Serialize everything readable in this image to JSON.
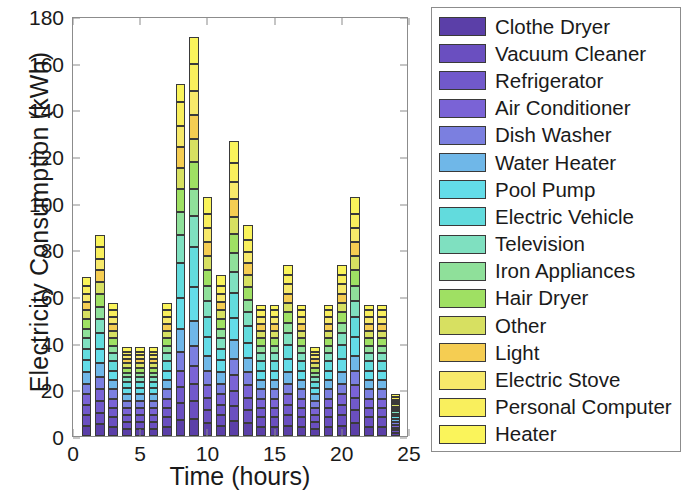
{
  "chart_data": {
    "type": "bar",
    "stacked": true,
    "title": "",
    "xlabel": "Time (hours)",
    "ylabel": "Electricity Consumption  (kWh)",
    "xlim": [
      0,
      25
    ],
    "ylim": [
      0,
      180
    ],
    "xticks": [
      0,
      5,
      10,
      15,
      20,
      25
    ],
    "yticks": [
      0,
      20,
      40,
      60,
      80,
      100,
      120,
      140,
      160,
      180
    ],
    "grid": false,
    "legend_position": "right-outside",
    "x": [
      1,
      2,
      3,
      4,
      5,
      6,
      7,
      8,
      9,
      10,
      11,
      12,
      13,
      14,
      15,
      16,
      17,
      18,
      19,
      20,
      21,
      22,
      23,
      24
    ],
    "totals": [
      68,
      86,
      51,
      34,
      34,
      34,
      51,
      154,
      171,
      103,
      69,
      120,
      86,
      51,
      51,
      69,
      51,
      35,
      51,
      69,
      103,
      51,
      51,
      17
    ],
    "series": [
      {
        "name": "Clothe Dryer",
        "color": "#5b3fa8",
        "values": [
          4.5,
          5.0,
          4.0,
          3.0,
          3.0,
          3.0,
          4.0,
          7.0,
          7.5,
          5.5,
          4.5,
          6.5,
          5.5,
          4.0,
          4.0,
          4.5,
          4.0,
          3.0,
          4.0,
          4.5,
          5.5,
          4.0,
          4.0,
          1.2
        ]
      },
      {
        "name": "Vacuum Cleaner",
        "color": "#6a4fc0",
        "values": [
          4.5,
          5.0,
          4.0,
          3.0,
          3.0,
          3.0,
          4.0,
          7.0,
          7.5,
          5.5,
          4.5,
          6.5,
          5.5,
          4.0,
          4.0,
          4.5,
          4.0,
          3.0,
          4.0,
          4.5,
          5.5,
          4.0,
          4.0,
          1.2
        ]
      },
      {
        "name": "Refrigerator",
        "color": "#7159cb",
        "values": [
          4.5,
          5.0,
          4.0,
          3.0,
          3.0,
          3.0,
          4.0,
          7.0,
          7.5,
          5.5,
          4.5,
          6.5,
          5.5,
          4.0,
          4.0,
          4.5,
          4.0,
          3.0,
          4.0,
          4.5,
          5.5,
          4.0,
          4.0,
          1.2
        ]
      },
      {
        "name": "Air Conditioner",
        "color": "#7a63d6",
        "values": [
          4.5,
          5.0,
          4.0,
          3.0,
          3.0,
          3.0,
          4.0,
          7.0,
          7.5,
          5.5,
          4.5,
          6.5,
          5.5,
          4.0,
          4.0,
          4.5,
          4.0,
          3.0,
          4.0,
          4.5,
          5.5,
          4.0,
          4.0,
          1.2
        ]
      },
      {
        "name": "Dish Washer",
        "color": "#7b7fe0",
        "values": [
          4.5,
          5.5,
          4.0,
          3.0,
          3.0,
          3.0,
          4.0,
          8.0,
          8.5,
          6.0,
          4.5,
          7.0,
          5.5,
          4.0,
          4.0,
          4.5,
          4.0,
          3.0,
          4.0,
          4.5,
          6.0,
          4.0,
          4.0,
          1.2
        ]
      },
      {
        "name": "Water Heater",
        "color": "#6fb7e8",
        "values": [
          5.0,
          6.0,
          4.0,
          3.0,
          3.0,
          3.0,
          4.0,
          10.0,
          11.0,
          6.5,
          5.0,
          8.0,
          6.0,
          4.0,
          4.0,
          5.0,
          4.0,
          3.0,
          4.0,
          5.0,
          6.5,
          4.0,
          4.0,
          1.2
        ]
      },
      {
        "name": "Pool Pump",
        "color": "#63dce8",
        "values": [
          5.0,
          6.0,
          4.0,
          2.5,
          2.5,
          2.5,
          4.0,
          13.0,
          14.5,
          8.0,
          5.0,
          9.5,
          6.5,
          4.0,
          4.0,
          5.5,
          4.0,
          2.5,
          4.0,
          5.5,
          8.0,
          4.0,
          4.0,
          1.2
        ]
      },
      {
        "name": "Electric Vehicle",
        "color": "#62dbdd",
        "values": [
          5.0,
          6.5,
          4.0,
          2.5,
          2.5,
          2.5,
          4.0,
          15.0,
          17.0,
          8.5,
          5.0,
          11.0,
          7.0,
          4.0,
          4.0,
          6.0,
          4.0,
          2.5,
          4.0,
          6.0,
          8.5,
          4.0,
          4.0,
          1.2
        ]
      },
      {
        "name": "Television",
        "color": "#7fe0c0",
        "values": [
          4.5,
          6.0,
          3.5,
          2.2,
          2.2,
          2.2,
          3.5,
          12.0,
          13.5,
          7.0,
          4.5,
          9.0,
          6.0,
          3.5,
          3.5,
          5.0,
          3.5,
          2.2,
          3.5,
          5.0,
          7.0,
          3.5,
          3.5,
          1.0
        ]
      },
      {
        "name": "Iron Appliances",
        "color": "#8fe09a",
        "values": [
          4.0,
          5.5,
          3.2,
          2.0,
          2.0,
          2.0,
          3.2,
          10.0,
          11.5,
          6.5,
          4.0,
          8.0,
          5.5,
          3.2,
          3.2,
          4.5,
          3.2,
          2.0,
          3.2,
          4.5,
          6.5,
          3.2,
          3.2,
          1.0
        ]
      },
      {
        "name": "Hair Dryer",
        "color": "#9fe063",
        "values": [
          4.0,
          5.5,
          3.2,
          2.0,
          2.0,
          2.0,
          3.2,
          10.0,
          11.5,
          6.5,
          4.0,
          8.0,
          5.5,
          3.2,
          3.2,
          4.5,
          3.2,
          2.0,
          3.2,
          4.5,
          6.5,
          3.2,
          3.2,
          1.0
        ]
      },
      {
        "name": "Other",
        "color": "#d7e061",
        "values": [
          4.0,
          5.0,
          3.0,
          2.0,
          2.0,
          2.0,
          3.0,
          9.0,
          10.0,
          6.0,
          4.0,
          7.5,
          5.0,
          3.0,
          3.0,
          4.0,
          3.0,
          2.0,
          3.0,
          4.0,
          6.0,
          3.0,
          3.0,
          1.0
        ]
      },
      {
        "name": "Light",
        "color": "#f5cd52",
        "values": [
          3.5,
          5.0,
          3.0,
          2.0,
          2.0,
          2.0,
          3.0,
          9.0,
          10.0,
          6.0,
          3.5,
          7.5,
          5.0,
          3.0,
          3.0,
          4.0,
          3.0,
          2.0,
          3.0,
          4.0,
          6.0,
          3.0,
          3.0,
          1.0
        ]
      },
      {
        "name": "Electric Stove",
        "color": "#f7e96a",
        "values": [
          3.5,
          5.0,
          3.0,
          1.5,
          1.5,
          1.5,
          3.0,
          9.0,
          10.5,
          6.0,
          3.5,
          7.5,
          5.0,
          3.0,
          3.0,
          4.0,
          3.0,
          1.5,
          3.0,
          4.0,
          6.0,
          3.0,
          3.0,
          1.0
        ]
      },
      {
        "name": "Personal Computer",
        "color": "#f9ef5d",
        "values": [
          3.5,
          5.0,
          3.0,
          1.5,
          1.5,
          1.5,
          3.0,
          10.0,
          11.5,
          6.0,
          3.5,
          8.0,
          5.0,
          3.0,
          3.0,
          4.0,
          3.0,
          1.5,
          3.0,
          4.0,
          6.0,
          3.0,
          3.0,
          1.0
        ]
      },
      {
        "name": "Heater",
        "color": "#faf45b",
        "values": [
          3.5,
          5.0,
          3.1,
          1.8,
          1.8,
          1.8,
          3.1,
          8.0,
          11.5,
          7.5,
          4.5,
          9.5,
          6.5,
          2.1,
          2.1,
          4.5,
          2.1,
          1.8,
          2.1,
          4.5,
          7.5,
          2.1,
          2.1,
          1.6
        ]
      }
    ]
  },
  "axes": {
    "ylabel": "Electricity Consumption  (kWh)",
    "xlabel": "Time (hours)",
    "yticklabels": [
      "0",
      "20",
      "40",
      "60",
      "80",
      "100",
      "120",
      "140",
      "160",
      "180"
    ],
    "xticklabels": [
      "0",
      "5",
      "10",
      "15",
      "20",
      "25"
    ]
  },
  "legend": {
    "items": [
      {
        "label": "Clothe Dryer",
        "color": "#5b3fa8"
      },
      {
        "label": "Vacuum Cleaner",
        "color": "#6a4fc0"
      },
      {
        "label": "Refrigerator",
        "color": "#7159cb"
      },
      {
        "label": "Air Conditioner",
        "color": "#7a63d6"
      },
      {
        "label": "Dish Washer",
        "color": "#7b7fe0"
      },
      {
        "label": "Water Heater",
        "color": "#6fb7e8"
      },
      {
        "label": "Pool Pump",
        "color": "#63dce8"
      },
      {
        "label": "Electric Vehicle",
        "color": "#62dbdd"
      },
      {
        "label": "Television",
        "color": "#7fe0c0"
      },
      {
        "label": "Iron Appliances",
        "color": "#8fe09a"
      },
      {
        "label": "Hair Dryer",
        "color": "#9fe063"
      },
      {
        "label": "Other",
        "color": "#d7e061"
      },
      {
        "label": "Light",
        "color": "#f5cd52"
      },
      {
        "label": "Electric Stove",
        "color": "#f7e96a"
      },
      {
        "label": "Personal Computer",
        "color": "#f9ef5d"
      },
      {
        "label": "Heater",
        "color": "#faf45b"
      }
    ]
  }
}
